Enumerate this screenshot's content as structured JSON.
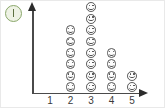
{
  "badge": {
    "icon": "info-circle-icon",
    "letter": "I",
    "border_color": "#8aa76a",
    "fill_color": "#eef2e4"
  },
  "axes": {
    "x_arrow_icon": "arrow-right-icon",
    "y_arrow_icon": "arrow-up-icon",
    "axis_color": "#4a4a4a"
  },
  "chart_data": {
    "type": "bar",
    "title": "",
    "xlabel": "",
    "ylabel": "",
    "categories": [
      "1",
      "2",
      "3",
      "4",
      "5"
    ],
    "values": [
      0,
      6,
      8,
      4,
      2
    ],
    "ylim": [
      0,
      8
    ],
    "grid": false,
    "legend": null,
    "marker": "smiley-face-icon"
  }
}
